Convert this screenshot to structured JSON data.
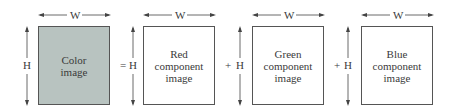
{
  "diagram": {
    "width_label": "W",
    "height_label": "H",
    "operators": [
      "=",
      "+",
      "+"
    ],
    "panels": [
      {
        "label_lines": [
          "Color",
          "image"
        ],
        "fill": "#b8c3c0"
      },
      {
        "label_lines": [
          "Red",
          "component",
          "image"
        ],
        "fill": "#ffffff"
      },
      {
        "label_lines": [
          "Green",
          "component",
          "image"
        ],
        "fill": "#ffffff"
      },
      {
        "label_lines": [
          "Blue",
          "component",
          "image"
        ],
        "fill": "#ffffff"
      }
    ]
  }
}
